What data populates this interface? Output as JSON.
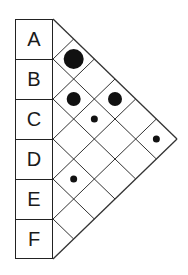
{
  "diagram": {
    "type": "pairwise-triangle-matrix",
    "markers": [
      "A",
      "B",
      "C",
      "D",
      "E",
      "F"
    ],
    "pairs": [
      {
        "a": "A",
        "b": "B",
        "size": "large"
      },
      {
        "a": "B",
        "b": "C",
        "size": "medium"
      },
      {
        "a": "A",
        "b": "D",
        "size": "medium"
      },
      {
        "a": "B",
        "b": "D",
        "size": "small"
      },
      {
        "a": "A",
        "b": "F",
        "size": "small"
      },
      {
        "a": "D",
        "b": "E",
        "size": "small"
      }
    ],
    "dot_radius": {
      "large": 10,
      "medium": 7,
      "small": 3.5
    },
    "colors": {
      "line": "#333333",
      "dot": "#111111",
      "background": "#ffffff"
    }
  }
}
